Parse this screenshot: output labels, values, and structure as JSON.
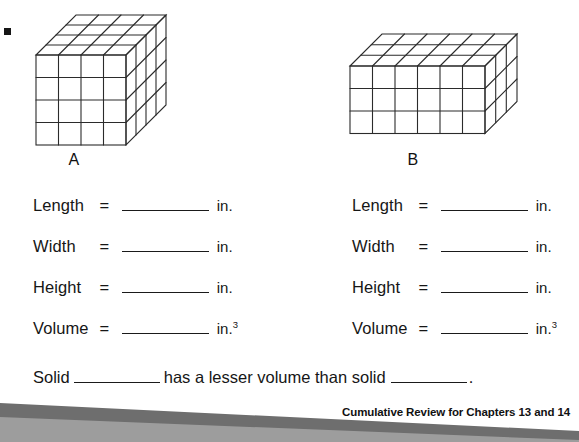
{
  "page": {
    "width": 579,
    "height": 442,
    "background": "#ffffff"
  },
  "figures": [
    {
      "id": "solid-a",
      "label": "A",
      "type": "unit-cube-solid",
      "columns": 4,
      "rows": 4,
      "depth": 4,
      "stroke": "#2b2b2b"
    },
    {
      "id": "solid-b",
      "label": "B",
      "type": "unit-cube-solid",
      "columns": 6,
      "rows": 3,
      "depth": 3,
      "stroke": "#2b2b2b"
    }
  ],
  "columns": [
    {
      "id": "column-a",
      "fields": [
        {
          "name": "Length",
          "equals": "=",
          "value": "",
          "unit": "in.",
          "exponent": ""
        },
        {
          "name": "Width",
          "equals": "=",
          "value": "",
          "unit": "in.",
          "exponent": ""
        },
        {
          "name": "Height",
          "equals": "=",
          "value": "",
          "unit": "in.",
          "exponent": ""
        },
        {
          "name": "Volume",
          "equals": "=",
          "value": "",
          "unit": "in.",
          "exponent": "3"
        }
      ]
    },
    {
      "id": "column-b",
      "fields": [
        {
          "name": "Length",
          "equals": "=",
          "value": "",
          "unit": "in.",
          "exponent": ""
        },
        {
          "name": "Width",
          "equals": "=",
          "value": "",
          "unit": "in.",
          "exponent": ""
        },
        {
          "name": "Height",
          "equals": "=",
          "value": "",
          "unit": "in.",
          "exponent": ""
        },
        {
          "name": "Volume",
          "equals": "=",
          "value": "",
          "unit": "in.",
          "exponent": "3"
        }
      ]
    }
  ],
  "sentence": {
    "lead": "Solid",
    "answer_1": "",
    "middle": "has a lesser volume than solid",
    "answer_2": "",
    "period": "."
  },
  "footer": {
    "text": "Cumulative Review for Chapters 13 and 14",
    "wave_dark": "#6e6e6e",
    "wave_light": "#9d9d9d"
  }
}
